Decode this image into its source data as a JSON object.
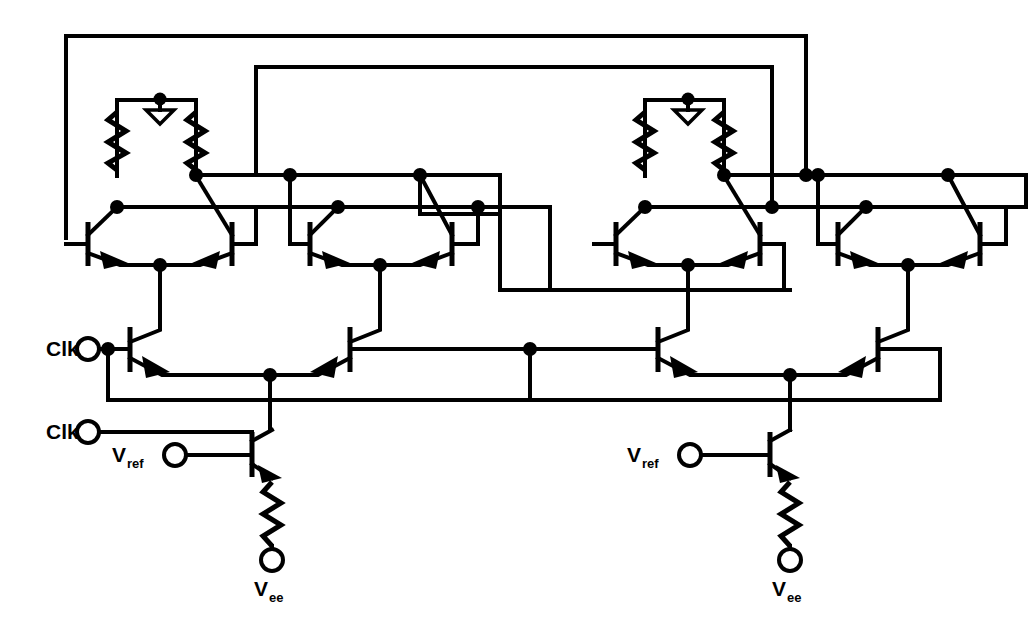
{
  "figure": {
    "kind": "circuit-schematic",
    "technology": "ECL",
    "background_color": "#ffffff",
    "line_color": "#000000",
    "width": 1031,
    "height": 621
  },
  "labels": {
    "clk": "Clk",
    "clk_bar": "Clk",
    "vref": "V",
    "vref_sub": "ref",
    "vee": "V",
    "vee_sub": "ee"
  },
  "terminals": [
    {
      "id": "clk-top",
      "label": "Clk",
      "sub": "",
      "x": 88,
      "y": 349,
      "label_x": 46,
      "label_y": 356
    },
    {
      "id": "clk-bottom",
      "label": "Clk",
      "sub": "",
      "x": 88,
      "y": 432,
      "label_x": 46,
      "label_y": 439
    },
    {
      "id": "vref-left",
      "label": "V",
      "sub": "ref",
      "x": 175,
      "y": 455,
      "label_x": 110,
      "label_y": 462
    },
    {
      "id": "vref-right",
      "label": "V",
      "sub": "ref",
      "x": 690,
      "y": 455,
      "label_x": 625,
      "label_y": 462
    },
    {
      "id": "vee-left",
      "label": "V",
      "sub": "ee",
      "x": 272,
      "y": 560,
      "label_x": 253,
      "label_y": 596
    },
    {
      "id": "vee-right",
      "label": "V",
      "sub": "ee",
      "x": 790,
      "y": 560,
      "label_x": 771,
      "label_y": 596
    }
  ],
  "blocks": [
    {
      "id": "master-latch",
      "role": "master",
      "x": 60,
      "label": "master latch"
    },
    {
      "id": "slave-latch",
      "role": "slave",
      "x": 580,
      "label": "slave latch"
    }
  ],
  "devices": {
    "differential_pairs": 4,
    "clock_switch_pairs": 2,
    "current_source_transistors": 2,
    "load_resistors": 4,
    "emitter_resistors": 2,
    "ground_symbols": 2,
    "junction_dots": 28
  },
  "nets": [
    {
      "id": "feedback-outer",
      "description": "outer top feedback bus"
    },
    {
      "id": "feedback-inner",
      "description": "inner top feedback bus"
    },
    {
      "id": "bus-upper",
      "description": "upper collector/base bus"
    },
    {
      "id": "bus-lower",
      "description": "lower collector/base bus"
    },
    {
      "id": "clk-net",
      "description": "clock distribution"
    },
    {
      "id": "clkbar-net",
      "description": "complementary clock distribution"
    },
    {
      "id": "vee-net",
      "description": "negative supply rail"
    }
  ]
}
